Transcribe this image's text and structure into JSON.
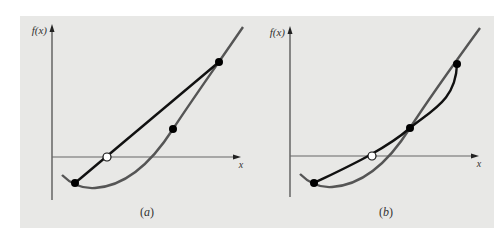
{
  "figure": {
    "background": "#e8e8e6",
    "panels": [
      {
        "id": "a",
        "caption": "(a)",
        "y_axis_label": "f(x)",
        "x_axis_label": "x",
        "description": "Linear interpolation (secant/false position) between two points on a convex curve",
        "curve_color": "#555555",
        "chord_color": "#111111",
        "points": {
          "lower": [
            75,
            183
          ],
          "middle": [
            173,
            129
          ],
          "upper": [
            219,
            62
          ],
          "root_estimate_open": [
            107,
            157
          ]
        }
      },
      {
        "id": "b",
        "caption": "(b)",
        "y_axis_label": "f(x)",
        "x_axis_label": "x",
        "description": "Quadratic interpolation through three points on a convex curve",
        "curve_color": "#555555",
        "interp_color": "#111111",
        "points": {
          "lower": [
            314,
            183
          ],
          "middle": [
            410,
            128
          ],
          "upper": [
            457,
            64
          ],
          "root_estimate_open": [
            372,
            156
          ]
        }
      }
    ]
  }
}
